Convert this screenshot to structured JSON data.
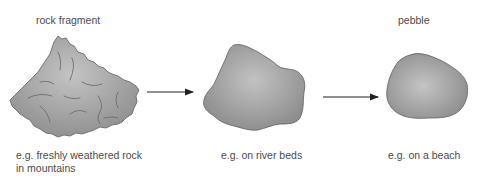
{
  "diagram": {
    "stages": [
      {
        "id": "rock-fragment",
        "title": "rock fragment",
        "caption_lines": [
          "e.g. freshly weathered rock",
          "in mountains"
        ]
      },
      {
        "id": "rounded-stone",
        "title": "",
        "caption_lines": [
          "e.g. on river beds"
        ]
      },
      {
        "id": "pebble",
        "title": "pebble",
        "caption_lines": [
          "e.g. on a beach"
        ]
      }
    ],
    "colors": {
      "rock_fill_light": "#bdbdbd",
      "rock_fill_dark": "#8e8e8e",
      "rock_outline": "#6a6a6a",
      "crack_line": "#6e6e6e",
      "arrow": "#222222",
      "text": "#4a4a4a"
    }
  }
}
